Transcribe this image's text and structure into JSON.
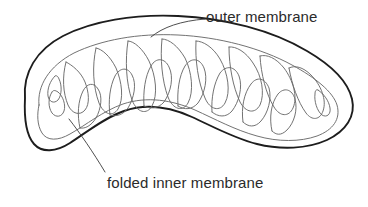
{
  "figure": {
    "kind": "biology-diagram",
    "background_color": "#ffffff"
  },
  "labels": {
    "outer_membrane": "outer membrane",
    "inner_membrane": "folded inner membrane"
  },
  "colors": {
    "outer_membrane_stroke": "#1d1d1d",
    "inner_membrane_stroke": "#6a6a6a",
    "leader_line_stroke": "#3a3a3a",
    "text": "#2b2b2b"
  },
  "strokes": {
    "outer_membrane_width": "1.9",
    "inner_membrane_width": "0.9",
    "leader_line_width": "0.9"
  },
  "geometry": {
    "outer_membrane_path": "M 25 96 C 22 70 38 46 68 33 C 104 18 160 15 214 22 C 266 29 310 45 338 68 C 354 81 358 96 353 110 C 347 126 331 138 309 145 C 285 152 258 149 234 140 C 210 131 191 119 170 112 C 148 104 124 103 101 114 C 82 123 67 140 52 146 C 38 152 28 142 25 124 C 24 114 24 104 25 96 Z",
    "inner_membrane_path": "M 43 104 C 41 88 52 70 76 59 C 100 48 128 45 152 48 C 156 44 160 41 166 41 C 174 41 180 46 181 54 C 182 62 178 69 172 73 C 168 76 163 77 158 77 C 153 77 148 75 146 71 C 144 67 145 63 148 61 C 151 59 155 60 157 63 C 159 66 158 70 155 72 C 152 74 147 73 144 70 C 140 66 140 59 144 54 C 139 53 133 54 129 58 C 124 63 123 72 127 79 C 131 86 139 89 146 87 C 152 85 156 80 157 74 C 159 78 163 81 168 82 C 176 84 184 80 188 73 C 192 66 191 57 186 51 C 192 49 199 48 206 49 C 206 45 209 41 214 40 C 221 39 227 44 228 51 C 229 58 226 65 220 69 C 215 72 209 73 204 71 C 199 69 196 64 197 59 C 198 55 201 53 204 54 C 207 55 208 59 206 62 C 204 65 200 65 197 63 C 193 60 192 53 196 48 C 202 46 208 46 214 47 C 213 43 215 39 219 37 C 226 34 234 38 237 45 C 240 52 238 61 232 66 C 227 70 220 72 214 70 C 208 68 204 63 204 57 C 207 61 212 63 218 63 C 226 63 233 58 236 50 C 239 42 237 33 231 28 C 238 28 245 29 252 31 C 253 27 257 24 262 24 C 269 25 274 31 274 39 C 274 47 269 54 262 57 C 256 59 250 58 246 54 C 242 50 241 44 244 40 C 246 37 250 36 253 38 C 256 40 256 44 254 47 C 251 50 246 49 243 46 C 239 42 239 35 244 30 C 250 30 257 32 263 34 C 264 30 268 28 273 29 C 280 31 284 38 283 46 C 282 54 276 60 269 62 C 263 64 257 62 253 58 C 250 54 250 48 253 45 C 256 43 260 43 262 46 C 265 49 264 53 261 55 C 258 57 253 56 251 52 C 248 48 249 41 254 37 C 261 38 268 41 274 44 C 276 41 280 39 285 41 C 292 44 295 52 293 60 C 291 67 285 72 278 73 C 272 74 266 72 263 67 C 260 63 261 57 264 54 C 267 52 271 53 273 56 C 275 59 274 63 271 65 C 267 67 263 65 261 61 C 259 57 261 50 266 47 C 273 50 280 54 286 59 C 289 57 293 57 297 60 C 303 65 304 74 300 81 C 296 87 289 90 283 89 C 277 88 272 84 271 78 C 270 73 272 68 276 66 C 279 65 283 66 284 70 C 286 73 284 77 281 78 C 277 79 273 77 272 73 C 271 68 274 62 279 60 C 286 65 292 71 297 78 C 300 77 304 78 307 82 C 312 88 311 97 306 103 C 301 108 294 110 288 108 C 283 106 279 101 279 95 C 279 90 282 86 286 85 C 289 84 293 86 294 90 C 295 93 293 97 290 98 C 286 99 282 96 281 92 C 280 87 284 81 289 80 C 294 87 298 95 301 103 C 300 110 295 117 288 121 C 281 125 272 126 264 124 C 256 122 248 117 241 111 C 234 105 227 99 219 94 C 210 88 200 85 190 87 C 181 89 174 96 170 104 C 167 111 167 120 171 126 C 165 128 158 127 153 123 C 147 118 146 109 149 102 C 152 95 160 91 167 93 C 172 94 176 98 177 103 C 178 108 175 113 171 114 C 167 115 163 112 162 108 C 161 104 163 100 166 99 C 170 98 174 101 175 105 C 176 111 172 117 166 118 C 160 115 155 110 152 104 C 147 106 141 105 137 101 C 131 96 130 87 134 80 C 138 74 146 71 153 73 C 158 75 162 79 162 85 C 162 90 159 94 155 95 C 151 96 147 93 147 89 C 146 85 149 82 152 82 C 156 82 159 86 158 90 C 157 96 152 101 146 101 C 141 97 137 92 135 86 C 130 87 124 85 121 81 C 116 75 117 66 122 60 C 127 54 135 52 141 55 C 146 57 149 62 148 67 C 147 72 143 76 139 76 C 135 76 132 73 132 69 C 132 65 135 62 139 63 C 142 64 144 68 143 72 C 141 77 136 81 130 80 C 126 76 123 71 122 65 C 117 67 111 66 107 62 C 105 60 104 57 104 54 C 98 59 92 66 88 74 C 83 83 81 94 83 104 C 85 114 91 122 100 126 C 94 130 86 131 79 128 C 71 125 66 117 66 108 C 66 100 71 93 78 91 C 84 89 90 92 92 98 C 94 103 92 109 87 111 C 83 113 78 111 76 107 C 74 103 76 98 80 96 C 85 94 90 97 92 102 C 94 109 90 116 83 118 C 76 115 70 109 67 101 C 61 103 55 101 51 96 C 47 91 47 84 50 79 C 47 86 45 95 46 104 C 46 113 49 121 55 127 C 50 131 43 131 38 127 C 33 122 31 114 33 107 C 35 100 41 96 48 97 C 48 99 47 102 43 104 Z",
    "leader_outer": "M 152 36 C 166 27 183 21 204 19",
    "leader_inner": "M 70 120 C 81 133 94 152 106 171"
  }
}
